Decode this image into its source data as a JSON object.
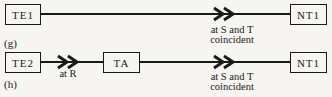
{
  "colors": {
    "background": "#f6f5f1",
    "ink": "#1a1a1a"
  },
  "rows": [
    {
      "label": "(g)",
      "nodes": [
        {
          "label": "TE1"
        },
        {
          "label": "NT1"
        }
      ],
      "connections": [
        {
          "annotation": [
            "at S and T",
            "coincident"
          ]
        }
      ]
    },
    {
      "label": "(h)",
      "nodes": [
        {
          "label": "TE2"
        },
        {
          "label": "TA"
        },
        {
          "label": "NT1"
        }
      ],
      "connections": [
        {
          "annotation": [
            "at R"
          ]
        },
        {
          "annotation": [
            "at S and T",
            "coincident"
          ]
        }
      ]
    }
  ]
}
